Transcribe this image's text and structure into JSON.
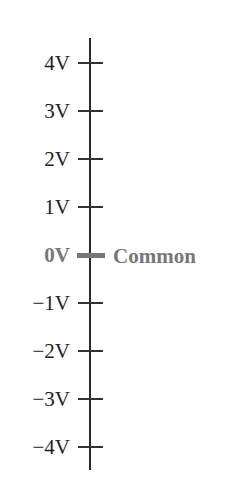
{
  "diagram": {
    "type": "voltage-scale",
    "axis": {
      "orientation": "vertical"
    },
    "ticks": [
      {
        "label": "4V",
        "value": 4,
        "y": 63
      },
      {
        "label": "3V",
        "value": 3,
        "y": 111
      },
      {
        "label": "2V",
        "value": 2,
        "y": 159
      },
      {
        "label": "1V",
        "value": 1,
        "y": 207
      },
      {
        "label": "0V",
        "value": 0,
        "y": 255,
        "highlight": true
      },
      {
        "label": "−1V",
        "value": -1,
        "y": 303
      },
      {
        "label": "−2V",
        "value": -2,
        "y": 351
      },
      {
        "label": "−3V",
        "value": -3,
        "y": 399
      },
      {
        "label": "−4V",
        "value": -4,
        "y": 447
      }
    ],
    "reference_label": "Common",
    "colors": {
      "axis": "#2a2a2a",
      "tick": "#333333",
      "text": "#222222",
      "highlight": "#777777"
    }
  }
}
